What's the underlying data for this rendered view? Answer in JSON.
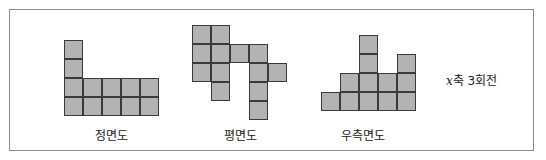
{
  "colors": {
    "cell_fill": "#b3b3b3",
    "cell_border": "#3a3a3a",
    "frame": "#8c8c8c"
  },
  "cell_size": 19,
  "views": [
    {
      "id": "front",
      "label": "정면도",
      "origin": [
        64,
        40
      ],
      "label_pos": [
        111,
        126
      ],
      "cells": [
        [
          0,
          0
        ],
        [
          0,
          1
        ],
        [
          0,
          2
        ],
        [
          1,
          2
        ],
        [
          2,
          2
        ],
        [
          3,
          2
        ],
        [
          4,
          2
        ],
        [
          0,
          3
        ],
        [
          1,
          3
        ],
        [
          2,
          3
        ],
        [
          3,
          3
        ],
        [
          4,
          3
        ]
      ]
    },
    {
      "id": "top",
      "label": "평면도",
      "origin": [
        192,
        25
      ],
      "label_pos": [
        240,
        126
      ],
      "cells": [
        [
          0,
          0
        ],
        [
          1,
          0
        ],
        [
          0,
          1
        ],
        [
          1,
          1
        ],
        [
          2,
          1
        ],
        [
          3,
          1
        ],
        [
          0,
          2
        ],
        [
          1,
          2
        ],
        [
          3,
          2
        ],
        [
          4,
          2
        ],
        [
          1,
          3
        ],
        [
          3,
          3
        ],
        [
          3,
          4
        ]
      ]
    },
    {
      "id": "right",
      "label": "우측면도",
      "origin": [
        321,
        35
      ],
      "label_pos": [
        363,
        126
      ],
      "cells": [
        [
          2,
          0
        ],
        [
          2,
          1
        ],
        [
          4,
          1
        ],
        [
          1,
          2
        ],
        [
          2,
          2
        ],
        [
          3,
          2
        ],
        [
          4,
          2
        ],
        [
          0,
          3
        ],
        [
          1,
          3
        ],
        [
          2,
          3
        ],
        [
          3,
          3
        ],
        [
          4,
          3
        ]
      ]
    }
  ],
  "note": {
    "axis": "x",
    "text": "축 3회전"
  }
}
